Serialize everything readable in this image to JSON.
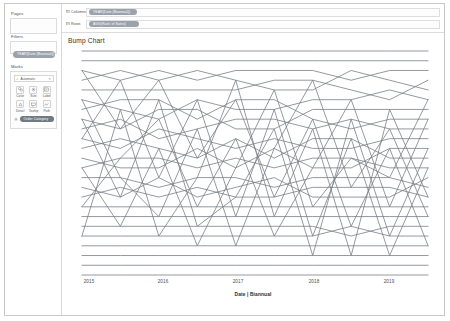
{
  "window": {
    "title": "Tableau Worksheet"
  },
  "sidebar": {
    "pages": {
      "label": "Pages"
    },
    "filters": {
      "label": "Filters",
      "pills": [
        {
          "text": "YEAR(Date (Biannual))"
        }
      ]
    },
    "marks": {
      "label": "Marks",
      "mark_type": "Automatic",
      "mark_type_check": "✓",
      "mark_type_caret": "▾",
      "buttons": [
        {
          "label": "Color",
          "icon": "color-palette-icon"
        },
        {
          "label": "Size",
          "icon": "size-icon"
        },
        {
          "label": "Label",
          "icon": "label-icon"
        },
        {
          "label": "Detail",
          "icon": "detail-icon"
        },
        {
          "label": "Tooltip",
          "icon": "tooltip-icon"
        },
        {
          "label": "Path",
          "icon": "path-icon"
        }
      ],
      "pills": [
        {
          "text": "Order Category"
        }
      ]
    }
  },
  "shelves": [
    {
      "name": "Columns",
      "label": "Columns",
      "icon": "columns-icon",
      "pill": "YEAR(Date (Biannual))"
    },
    {
      "name": "Rows",
      "label": "Rows",
      "icon": "rows-icon",
      "pill": "AGG(Rank of Sales)"
    }
  ],
  "chart_data": {
    "type": "line",
    "title": "Bump Chart",
    "xlabel": "Date | Biannual",
    "ylabel": "",
    "grid": false,
    "legend": false,
    "x_tick_labels": [
      "2015",
      "2016",
      "2017",
      "2018",
      "2019"
    ],
    "x_tick_positions_px": [
      84,
      158,
      233,
      309,
      384
    ],
    "x": [
      0,
      1,
      2,
      3,
      4,
      5,
      6,
      7,
      8,
      9
    ],
    "ylim": [
      1,
      24
    ],
    "y_inverted": true,
    "note": "Bump chart of sales rank by category over biannual periods; each series is a rank path (rank 1 at top).",
    "series": [
      {
        "name": "Series 1",
        "values": [
          1,
          1,
          1,
          1,
          1,
          1,
          1,
          1,
          1,
          1
        ]
      },
      {
        "name": "Series 2",
        "values": [
          2,
          2,
          2,
          2,
          2,
          2,
          2,
          2,
          2,
          2
        ]
      },
      {
        "name": "Series 3",
        "values": [
          3,
          4,
          3,
          4,
          3,
          3,
          3,
          4,
          3,
          3
        ]
      },
      {
        "name": "Series 4",
        "values": [
          4,
          3,
          4,
          3,
          4,
          5,
          5,
          3,
          4,
          5
        ]
      },
      {
        "name": "Series 5",
        "values": [
          5,
          5,
          5,
          5,
          5,
          4,
          4,
          5,
          6,
          4
        ]
      },
      {
        "name": "Series 6",
        "values": [
          6,
          7,
          8,
          6,
          7,
          7,
          6,
          6,
          5,
          6
        ]
      },
      {
        "name": "Series 7",
        "values": [
          7,
          6,
          6,
          8,
          6,
          6,
          8,
          9,
          8,
          8
        ]
      },
      {
        "name": "Series 8",
        "values": [
          8,
          9,
          7,
          7,
          9,
          9,
          7,
          7,
          7,
          7
        ]
      },
      {
        "name": "Series 9",
        "values": [
          9,
          8,
          10,
          9,
          8,
          8,
          9,
          8,
          9,
          9
        ]
      },
      {
        "name": "Series 10",
        "values": [
          10,
          11,
          9,
          10,
          11,
          10,
          11,
          11,
          10,
          10
        ]
      },
      {
        "name": "Series 11",
        "values": [
          11,
          10,
          11,
          12,
          10,
          12,
          10,
          10,
          12,
          12
        ]
      },
      {
        "name": "Series 12",
        "values": [
          12,
          13,
          13,
          11,
          13,
          11,
          13,
          13,
          11,
          11
        ]
      },
      {
        "name": "Series 13",
        "values": [
          13,
          12,
          12,
          13,
          12,
          13,
          12,
          12,
          13,
          13
        ]
      },
      {
        "name": "Series 14",
        "values": [
          14,
          14,
          15,
          14,
          14,
          15,
          14,
          14,
          14,
          15
        ]
      },
      {
        "name": "Series 15",
        "values": [
          15,
          16,
          14,
          16,
          15,
          14,
          16,
          16,
          16,
          14
        ]
      },
      {
        "name": "Series 16",
        "values": [
          16,
          15,
          16,
          15,
          16,
          16,
          15,
          15,
          15,
          16
        ]
      },
      {
        "name": "Series 17",
        "values": [
          17,
          17,
          17,
          17,
          17,
          17,
          17,
          17,
          17,
          17
        ]
      },
      {
        "name": "Series 18",
        "values": [
          18,
          18,
          18,
          18,
          18,
          18,
          18,
          18,
          18,
          18
        ]
      },
      {
        "name": "Series 19",
        "values": [
          19,
          19,
          19,
          19,
          19,
          19,
          19,
          20,
          19,
          19
        ]
      },
      {
        "name": "Series 20",
        "values": [
          20,
          20,
          20,
          20,
          20,
          20,
          20,
          19,
          20,
          20
        ]
      },
      {
        "name": "Series 21",
        "values": [
          21,
          21,
          21,
          21,
          21,
          21,
          21,
          21,
          21,
          21
        ]
      },
      {
        "name": "Series 22",
        "values": [
          22,
          22,
          22,
          22,
          22,
          22,
          22,
          22,
          22,
          22
        ]
      },
      {
        "name": "Series 23",
        "values": [
          23,
          23,
          23,
          23,
          23,
          23,
          23,
          23,
          23,
          23
        ]
      },
      {
        "name": "Series 24",
        "values": [
          24,
          24,
          24,
          24,
          24,
          24,
          24,
          24,
          24,
          24
        ]
      }
    ],
    "crossing_series": [
      {
        "name": "Cross A",
        "values": [
          3,
          9,
          4,
          12,
          6,
          16,
          8,
          19,
          11,
          21
        ]
      },
      {
        "name": "Cross B",
        "values": [
          10,
          4,
          14,
          6,
          18,
          7,
          20,
          10,
          22,
          13
        ]
      },
      {
        "name": "Cross C",
        "values": [
          17,
          12,
          8,
          17,
          10,
          20,
          13,
          6,
          17,
          8
        ]
      },
      {
        "name": "Cross D",
        "values": [
          6,
          14,
          18,
          9,
          21,
          11,
          4,
          15,
          9,
          18
        ]
      },
      {
        "name": "Cross E",
        "values": [
          13,
          19,
          11,
          21,
          13,
          5,
          17,
          12,
          14,
          6
        ]
      },
      {
        "name": "Cross F",
        "values": [
          20,
          7,
          20,
          14,
          4,
          18,
          9,
          22,
          7,
          16
        ]
      },
      {
        "name": "Cross G",
        "values": [
          8,
          16,
          6,
          19,
          16,
          9,
          22,
          8,
          20,
          11
        ]
      }
    ],
    "line_color": "#7a7f85",
    "line_width": 0.8
  }
}
